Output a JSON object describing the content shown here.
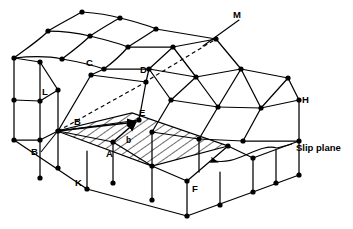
{
  "figure": {
    "type": "crystal-lattice-slip-diagram",
    "background_color": "#ffffff",
    "line_color": "#000000",
    "width": 353,
    "height": 229
  },
  "labels": {
    "M": "M",
    "C": "C",
    "D": "D",
    "L": "L",
    "H": "H",
    "B_vertex": "B",
    "B_callout": "B",
    "E": "E",
    "A": "A",
    "K": "K",
    "F": "F",
    "burgers_vector": "b"
  },
  "annotations": {
    "slip_plane": "Slip plane"
  },
  "geometry": {
    "note": "Isometric block of atoms; left region distorted by dislocation, right region regular.",
    "slip_plane_polygon": [
      [
        57,
        131
      ],
      [
        132,
        113
      ],
      [
        228,
        146
      ],
      [
        152,
        166
      ]
    ],
    "burgers_vector_arrow": {
      "from": [
        114,
        141
      ],
      "to": [
        139,
        120
      ]
    },
    "dashed_line": [
      [
        58,
        131
      ],
      [
        146,
        82
      ],
      [
        216,
        39
      ]
    ],
    "leader_curve": {
      "text_anchor": [
        281,
        148
      ],
      "arrow_tip": [
        196,
        155
      ]
    }
  }
}
